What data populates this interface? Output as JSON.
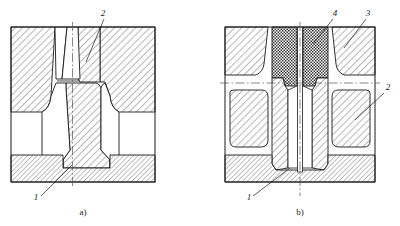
{
  "figure": {
    "title": "",
    "subfigures": [
      {
        "caption": "a)",
        "callouts": [
          {
            "id": "1",
            "text": "1"
          },
          {
            "id": "2",
            "text": "2"
          }
        ]
      },
      {
        "caption": "b)",
        "callouts": [
          {
            "id": "1",
            "text": "1"
          },
          {
            "id": "2",
            "text": "2"
          },
          {
            "id": "3",
            "text": "3"
          },
          {
            "id": "4",
            "text": "4"
          }
        ]
      }
    ]
  },
  "labels": {
    "a_num1": "1",
    "a_num2": "2",
    "a_caption": "a)",
    "b_num1": "1",
    "b_num2": "2",
    "b_num3": "3",
    "b_num4": "4",
    "b_caption": "b)"
  },
  "colors": {
    "line": "#1a1a1a",
    "hatch": "#4a4a4a",
    "fill": "#ffffff",
    "background": "#ffffff",
    "centerline": "#555555"
  }
}
